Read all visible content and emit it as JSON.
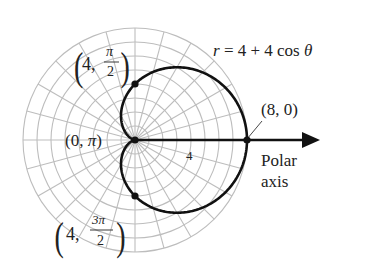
{
  "figure": {
    "width": 373,
    "height": 265,
    "pole": {
      "x": 135,
      "y": 140
    },
    "px_per_unit": 14,
    "grid": {
      "rings": 8,
      "spoke_step_deg": 15,
      "color": "#bdbdbd"
    },
    "curve": {
      "equation_label": {
        "r": "r",
        "rest": " = 4 + 4 cos ",
        "theta": "θ"
      },
      "a": 4,
      "b": 4,
      "color": "#111111"
    },
    "polar_axis": {
      "label_line1": "Polar",
      "label_line2": "axis",
      "end_x": 320
    },
    "points": [
      {
        "r": 8,
        "theta_deg": 0,
        "label": "(8, 0)"
      },
      {
        "r": 4,
        "theta_deg": 90,
        "label_num": "4,",
        "label_frac_top": "π",
        "label_frac_bot": "2"
      },
      {
        "r": 0,
        "theta_deg": 180,
        "label_pre": "(0, ",
        "label_pi": "π",
        "label_post": ")"
      },
      {
        "r": 4,
        "theta_deg": 270,
        "label_num": "4,",
        "label_frac_top": "3π",
        "label_frac_bot": "2"
      }
    ],
    "axis_tick_label": "4"
  }
}
